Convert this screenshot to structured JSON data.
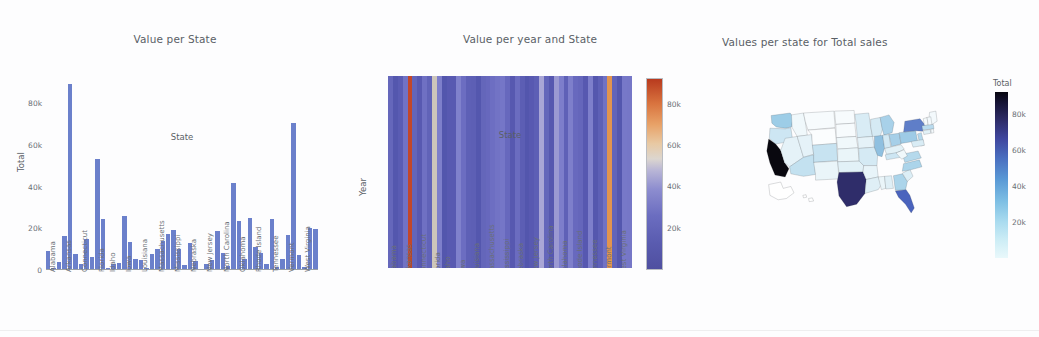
{
  "page": {
    "background": "#fdfdfe",
    "accent_bar_color": "#6b80cb"
  },
  "panels": {
    "bar": {
      "title": "Value per State"
    },
    "heatmap": {
      "title": "Value per year and State"
    },
    "map": {
      "title": "Values per state for Total sales"
    }
  },
  "chart_data": [
    {
      "type": "bar",
      "title": "Value per State",
      "xlabel": "State",
      "ylabel": "Total",
      "ylim": [
        0,
        92000
      ],
      "grid": false,
      "ytick_labels": [
        "0",
        "20k",
        "40k",
        "60k",
        "80k"
      ],
      "ytick_values": [
        0,
        20000,
        40000,
        60000,
        80000
      ],
      "xtick_labels": [
        "Alabama",
        "Arkansas",
        "Connecticut",
        "Florida",
        "Idaho",
        "Iowa",
        "Louisiana",
        "Massachusetts",
        "Mississippi",
        "Nebraska",
        "New Jersey",
        "North Carolina",
        "Oklahoma",
        "Rhode Island",
        "Tennessee",
        "Vermont",
        "West Virginia"
      ],
      "categories": [
        "Alabama",
        "Alaska",
        "Arizona",
        "Arkansas",
        "California",
        "Colorado",
        "Connecticut",
        "Delaware",
        "District of Columbia",
        "Florida",
        "Georgia",
        "Idaho",
        "Illinois",
        "Indiana",
        "Iowa",
        "Kansas",
        "Kentucky",
        "Louisiana",
        "Maine",
        "Maryland",
        "Massachusetts",
        "Michigan",
        "Minnesota",
        "Mississippi",
        "Missouri",
        "Montana",
        "Nebraska",
        "Nevada",
        "New Hampshire",
        "New Jersey",
        "New Mexico",
        "New York",
        "North Carolina",
        "North Dakota",
        "Ohio",
        "Oklahoma",
        "Oregon",
        "Pennsylvania",
        "Rhode Island",
        "South Carolina",
        "South Dakota",
        "Tennessee",
        "Texas",
        "Utah",
        "Vermont",
        "Virginia",
        "Washington",
        "West Virginia",
        "Wisconsin",
        "Wyoming"
      ],
      "values": [
        9000,
        1200,
        3800,
        16500,
        89000,
        7800,
        3100,
        15000,
        6400,
        53000,
        24500,
        800,
        3100,
        3300,
        25800,
        13200,
        5100,
        4600,
        1200,
        7900,
        10000,
        14000,
        17200,
        19000,
        10300,
        2600,
        12900,
        4300,
        700,
        2900,
        4800,
        18800,
        8000,
        2000,
        41500,
        23500,
        5400,
        24800,
        11000,
        8300,
        2700,
        24500,
        1600,
        5200,
        16800,
        70500,
        7200,
        1300,
        20000,
        19500
      ]
    },
    {
      "type": "heatmap",
      "title": "Value per year and State",
      "xlabel": "State",
      "ylabel": "Year",
      "ytick_labels": [
        "2,019.6",
        "2,019.8",
        "2,020",
        "2,020.2",
        "2,020.4"
      ],
      "ytick_values": [
        2019.6,
        2019.8,
        2020,
        2020.2,
        2020.4
      ],
      "xtick_labels": [
        "Alabama",
        "Arkansas",
        "Connecticut",
        "Florida",
        "Idaho",
        "Iowa",
        "Louisiana",
        "Massachusetts",
        "Mississippi",
        "Nebraska",
        "New Jersey",
        "North Carolina",
        "Oklahoma",
        "Rhode Island",
        "Tennessee",
        "Vermont",
        "West Virginia"
      ],
      "colorbar": {
        "tick_labels": [
          "20k",
          "40k",
          "60k",
          "80k"
        ],
        "tick_values": [
          20000,
          40000,
          60000,
          80000
        ],
        "range": [
          0,
          92000
        ],
        "colormap": "diverging-blue-white-orange"
      },
      "columns": [
        {
          "state": "Alabama",
          "value": 9000,
          "color": "#6567bb"
        },
        {
          "state": "Alaska",
          "value": 1200,
          "color": "#5457ae"
        },
        {
          "state": "Arizona",
          "value": 3800,
          "color": "#5a5cb3"
        },
        {
          "state": "Arkansas",
          "value": 16500,
          "color": "#7172c4"
        },
        {
          "state": "California",
          "value": 89000,
          "color": "#c2472a"
        },
        {
          "state": "Colorado",
          "value": 7800,
          "color": "#6365ba"
        },
        {
          "state": "Connecticut",
          "value": 3100,
          "color": "#5859b1"
        },
        {
          "state": "Delaware",
          "value": 15000,
          "color": "#6f70c3"
        },
        {
          "state": "District of Columbia",
          "value": 6400,
          "color": "#6163b8"
        },
        {
          "state": "Florida",
          "value": 53000,
          "color": "#cdc6bb"
        },
        {
          "state": "Georgia",
          "value": 24500,
          "color": "#7e7fcb"
        },
        {
          "state": "Idaho",
          "value": 800,
          "color": "#5356ad"
        },
        {
          "state": "Illinois",
          "value": 3100,
          "color": "#5859b1"
        },
        {
          "state": "Indiana",
          "value": 3300,
          "color": "#5859b1"
        },
        {
          "state": "Iowa",
          "value": 25800,
          "color": "#8081cc"
        },
        {
          "state": "Kansas",
          "value": 13200,
          "color": "#6c6dc1"
        },
        {
          "state": "Kentucky",
          "value": 5100,
          "color": "#5e60b6"
        },
        {
          "state": "Louisiana",
          "value": 4600,
          "color": "#5d5fb5"
        },
        {
          "state": "Maine",
          "value": 1200,
          "color": "#5457ae"
        },
        {
          "state": "Maryland",
          "value": 7900,
          "color": "#6466ba"
        },
        {
          "state": "Massachusetts",
          "value": 10000,
          "color": "#6768bd"
        },
        {
          "state": "Michigan",
          "value": 14000,
          "color": "#6d6ec2"
        },
        {
          "state": "Minnesota",
          "value": 17200,
          "color": "#7273c5"
        },
        {
          "state": "Mississippi",
          "value": 19000,
          "color": "#7576c7"
        },
        {
          "state": "Missouri",
          "value": 10300,
          "color": "#6768bd"
        },
        {
          "state": "Montana",
          "value": 2600,
          "color": "#5758b0"
        },
        {
          "state": "Nebraska",
          "value": 12900,
          "color": "#6b6cc0"
        },
        {
          "state": "Nevada",
          "value": 4300,
          "color": "#5c5eb4"
        },
        {
          "state": "New Hampshire",
          "value": 700,
          "color": "#5356ad"
        },
        {
          "state": "New Jersey",
          "value": 2900,
          "color": "#5859b1"
        },
        {
          "state": "New Mexico",
          "value": 4800,
          "color": "#5d5fb5"
        },
        {
          "state": "New York",
          "value": 18800,
          "color": "#a9a6d6"
        },
        {
          "state": "North Carolina",
          "value": 8000,
          "color": "#6466ba"
        },
        {
          "state": "North Dakota",
          "value": 2000,
          "color": "#5657af"
        },
        {
          "state": "Ohio",
          "value": 41500,
          "color": "#9b99d2"
        },
        {
          "state": "Oklahoma",
          "value": 23500,
          "color": "#7d7ecb"
        },
        {
          "state": "Oregon",
          "value": 5400,
          "color": "#5f61b7"
        },
        {
          "state": "Pennsylvania",
          "value": 24800,
          "color": "#7e7fcb"
        },
        {
          "state": "Rhode Island",
          "value": 11000,
          "color": "#6869be"
        },
        {
          "state": "South Carolina",
          "value": 8300,
          "color": "#6566bb"
        },
        {
          "state": "South Dakota",
          "value": 2700,
          "color": "#5758b0"
        },
        {
          "state": "Tennessee",
          "value": 24500,
          "color": "#7e7fcb"
        },
        {
          "state": "Texas",
          "value": 1600,
          "color": "#5557ae"
        },
        {
          "state": "Utah",
          "value": 5200,
          "color": "#5e60b6"
        },
        {
          "state": "Vermont",
          "value": 16800,
          "color": "#7172c4"
        },
        {
          "state": "Virginia",
          "value": 70500,
          "color": "#e2944f"
        },
        {
          "state": "Washington",
          "value": 7200,
          "color": "#6264b9"
        },
        {
          "state": "West Virginia",
          "value": 1300,
          "color": "#5457ae"
        },
        {
          "state": "Wisconsin",
          "value": 20000,
          "color": "#7778c8"
        },
        {
          "state": "Wyoming",
          "value": 19500,
          "color": "#7677c7"
        }
      ]
    },
    {
      "type": "choropleth",
      "title": "Values per state for Total sales",
      "colorbar": {
        "title": "Total",
        "tick_labels": [
          "20k",
          "40k",
          "60k",
          "80k"
        ],
        "tick_values": [
          20000,
          40000,
          60000,
          80000
        ],
        "range": [
          0,
          92000
        ],
        "colormap": "light-cyan-to-black"
      },
      "states": [
        {
          "code": "CA",
          "name": "California",
          "value": 89000,
          "color": "#09080f"
        },
        {
          "code": "TX",
          "name": "Texas",
          "value": 68000,
          "color": "#2f2d6a"
        },
        {
          "code": "FL",
          "name": "Florida",
          "value": 53000,
          "color": "#4a63bd"
        },
        {
          "code": "NY",
          "name": "New York",
          "value": 47000,
          "color": "#5f7ec8"
        },
        {
          "code": "IL",
          "name": "Illinois",
          "value": 31000,
          "color": "#8fc0e0"
        },
        {
          "code": "PA",
          "name": "Pennsylvania",
          "value": 28000,
          "color": "#9ecbe6"
        },
        {
          "code": "OH",
          "name": "Ohio",
          "value": 26000,
          "color": "#a6cfe8"
        },
        {
          "code": "MI",
          "name": "Michigan",
          "value": 25000,
          "color": "#a8d1e9"
        },
        {
          "code": "WA",
          "name": "Washington",
          "value": 27000,
          "color": "#9dcde7"
        },
        {
          "code": "NC",
          "name": "North Carolina",
          "value": 24000,
          "color": "#abd4ea"
        },
        {
          "code": "GA",
          "name": "Georgia",
          "value": 24000,
          "color": "#abd4ea"
        },
        {
          "code": "VA",
          "name": "Virginia",
          "value": 22000,
          "color": "#b5d9ec"
        },
        {
          "code": "NJ",
          "name": "New Jersey",
          "value": 22000,
          "color": "#b3d8ec"
        },
        {
          "code": "MA",
          "name": "Massachusetts",
          "value": 21000,
          "color": "#b9dbee"
        },
        {
          "code": "AZ",
          "name": "Arizona",
          "value": 18000,
          "color": "#c3e1f0"
        },
        {
          "code": "CO",
          "name": "Colorado",
          "value": 17000,
          "color": "#c7e3f1"
        },
        {
          "code": "OR",
          "name": "Oregon",
          "value": 15000,
          "color": "#cde6f3"
        },
        {
          "code": "TN",
          "name": "Tennessee",
          "value": 15000,
          "color": "#cde6f3"
        },
        {
          "code": "IN",
          "name": "Indiana",
          "value": 14000,
          "color": "#d2e9f4"
        },
        {
          "code": "MO",
          "name": "Missouri",
          "value": 13000,
          "color": "#d5eaf4"
        },
        {
          "code": "WI",
          "name": "Wisconsin",
          "value": 13000,
          "color": "#d5eaf4"
        },
        {
          "code": "MN",
          "name": "Minnesota",
          "value": 12000,
          "color": "#d9ecf5"
        },
        {
          "code": "MD",
          "name": "Maryland",
          "value": 12000,
          "color": "#d9ecf5"
        },
        {
          "code": "SC",
          "name": "South Carolina",
          "value": 11000,
          "color": "#dceef6"
        },
        {
          "code": "AL",
          "name": "Alabama",
          "value": 10000,
          "color": "#dfeff6"
        },
        {
          "code": "LA",
          "name": "Louisiana",
          "value": 10000,
          "color": "#dfeff6"
        },
        {
          "code": "KY",
          "name": "Kentucky",
          "value": 9000,
          "color": "#e2f1f7"
        },
        {
          "code": "OK",
          "name": "Oklahoma",
          "value": 9000,
          "color": "#e2f1f7"
        },
        {
          "code": "CT",
          "name": "Connecticut",
          "value": 9000,
          "color": "#e2f1f7"
        },
        {
          "code": "UT",
          "name": "Utah",
          "value": 8000,
          "color": "#e5f2f8"
        },
        {
          "code": "IA",
          "name": "Iowa",
          "value": 8000,
          "color": "#e5f2f8"
        },
        {
          "code": "NV",
          "name": "Nevada",
          "value": 8000,
          "color": "#e5f2f8"
        },
        {
          "code": "AR",
          "name": "Arkansas",
          "value": 7000,
          "color": "#e8f4f9"
        },
        {
          "code": "MS",
          "name": "Mississippi",
          "value": 6000,
          "color": "#eaf5f9"
        },
        {
          "code": "KS",
          "name": "Kansas",
          "value": 6000,
          "color": "#eaf5f9"
        },
        {
          "code": "NM",
          "name": "New Mexico",
          "value": 6000,
          "color": "#eaf5f9"
        },
        {
          "code": "NE",
          "name": "Nebraska",
          "value": 4000,
          "color": "#f0f8fb"
        },
        {
          "code": "WV",
          "name": "West Virginia",
          "value": 4000,
          "color": "#f0f8fb"
        },
        {
          "code": "ID",
          "name": "Idaho",
          "value": 4000,
          "color": "#f0f8fb"
        },
        {
          "code": "ME",
          "name": "Maine",
          "value": 4000,
          "color": "#f3f9fc"
        },
        {
          "code": "NH",
          "name": "New Hampshire",
          "value": 3000,
          "color": "#f3f9fc"
        },
        {
          "code": "RI",
          "name": "Rhode Island",
          "value": 3000,
          "color": "#f3f9fc"
        },
        {
          "code": "MT",
          "name": "Montana",
          "value": 2000,
          "color": "#f7fbfd"
        },
        {
          "code": "SD",
          "name": "South Dakota",
          "value": 2000,
          "color": "#f7fbfd"
        },
        {
          "code": "ND",
          "name": "North Dakota",
          "value": 2000,
          "color": "#f7fbfd"
        },
        {
          "code": "WY",
          "name": "Wyoming",
          "value": 1500,
          "color": "#fbfdfe"
        },
        {
          "code": "DE",
          "name": "Delaware",
          "value": 3000,
          "color": "#f3f9fc"
        },
        {
          "code": "VT",
          "name": "Vermont",
          "value": 2500,
          "color": "#f5fafc"
        },
        {
          "code": "AK",
          "name": "Alaska",
          "value": 1200,
          "color": "#ffffff"
        },
        {
          "code": "HI",
          "name": "Hawaii",
          "value": 1200,
          "color": "#ffffff"
        }
      ]
    }
  ]
}
